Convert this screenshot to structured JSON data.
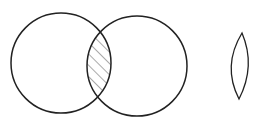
{
  "diagram": {
    "type": "venn-intersection",
    "stroke_color": "#222222",
    "hatch_color": "#555555",
    "background": "#ffffff",
    "circles": [
      {
        "name": "circle-a",
        "cx": 61,
        "cy": 63,
        "r": 50
      },
      {
        "name": "circle-b",
        "cx": 137,
        "cy": 66,
        "r": 50
      }
    ],
    "lens": {
      "name": "intersection-lens",
      "top_x": 242,
      "top_y": 33,
      "bottom_x": 239,
      "bottom_y": 99,
      "bulge": 14
    }
  }
}
